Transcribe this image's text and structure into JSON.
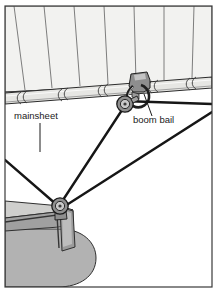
{
  "figure": {
    "type": "technical-line-illustration",
    "background_color": "#ffffff",
    "frame": {
      "border_color": "#3a3a3a",
      "border_width": 1,
      "inset_x": 4,
      "inset_y": 5
    },
    "palette": {
      "sail_fill": "#f2f2f0",
      "sail_seam": "#6b6b6b",
      "boom_fill": "#e3e3e1",
      "boom_outline": "#2b2b2b",
      "hull_fill": "#b2b2b2",
      "deck_fill": "#a5a5a5",
      "deck_top_fill": "#cfcfcd",
      "rope_color": "#1c1c1c",
      "hardware_fill": "#8a8a8a",
      "hardware_outline": "#202020",
      "leader_line": "#1a1a1a",
      "text_color": "#1a1a1a"
    }
  },
  "labels": [
    {
      "id": "mainsheet",
      "text": "mainsheet",
      "text_x": 14,
      "text_y": 119,
      "leader": {
        "x1": 40,
        "y1": 123,
        "x2": 40,
        "y2": 152
      }
    },
    {
      "id": "boom-bail",
      "text": "boom bail",
      "text_x": 133,
      "text_y": 123,
      "leader": {
        "x1": 152,
        "y1": 116,
        "x2": 144,
        "y2": 94
      }
    }
  ],
  "parts": {
    "sail": {
      "name": "mainsail",
      "seam_count": 7,
      "description": "light grey sail panel filling upper area with diagonal seam lines"
    },
    "boom": {
      "name": "boom",
      "description": "horizontal tapered spar running lower-left to upper-right",
      "sail_tie_count": 5
    },
    "upper_block": {
      "name": "upper-block",
      "description": "sheave block hanging from the boom bail",
      "cx": 128,
      "cy": 104
    },
    "lower_block": {
      "name": "lower-block",
      "description": "sheave block mounted on the deck fitting",
      "cx": 60,
      "cy": 207
    },
    "deck": {
      "name": "deck-and-hull",
      "description": "grey boat deck edge and rounded hull section at bottom left"
    }
  },
  "ropes": [
    {
      "id": "tail-left",
      "from": "lower-block",
      "to": "off-frame-left",
      "points": "5,162 60,207"
    },
    {
      "id": "bail-to-deck",
      "from": "upper-block",
      "to": "lower-block",
      "points": "126,108 60,205"
    },
    {
      "id": "standing-part",
      "from": "upper-block",
      "to": "off-frame-right",
      "points": "125,103 212,106"
    },
    {
      "id": "deck-to-right",
      "from": "lower-block",
      "to": "off-frame-right",
      "points": "64,208 215,110"
    }
  ]
}
